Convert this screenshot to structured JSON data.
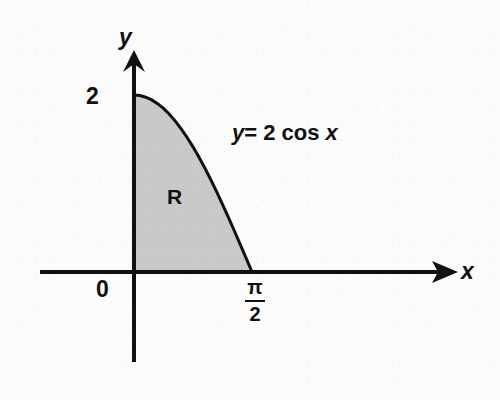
{
  "figure": {
    "background_color": "#fbfbfb",
    "ink_color": "#111111",
    "shade_color": "#c9c9c9"
  },
  "axes": {
    "y_axis_label": "y",
    "x_axis_label": "x",
    "origin_label": "0",
    "y_tick_label": "2",
    "x_tick_numerator": "π",
    "x_tick_denominator": "2"
  },
  "annotations": {
    "region_label": "R",
    "curve_equation_y": "y",
    "curve_equation_mid": "= 2 cos ",
    "curve_equation_x": "x",
    "curve_equation_full": "y = 2 cos x"
  },
  "chart_data": {
    "type": "area",
    "title": "",
    "xlabel": "x",
    "ylabel": "y",
    "function": "y = 2 cos x",
    "shaded_region_name": "R",
    "shaded_region_bounds": {
      "x_from": 0,
      "x_to": 1.5707963,
      "x_to_label": "π/2",
      "y_from": 0,
      "y_to_label": "2"
    },
    "xlim": [
      -1.05,
      3.05
    ],
    "ylim": [
      -1.25,
      2.45
    ],
    "grid": false,
    "legend": false,
    "x_tick_values": [
      0,
      1.5707963
    ],
    "x_tick_labels": [
      "0",
      "π/2"
    ],
    "y_tick_values": [
      2
    ],
    "y_tick_labels": [
      "2"
    ],
    "x": [
      0,
      0.0785,
      0.1571,
      0.2356,
      0.3142,
      0.3927,
      0.4712,
      0.5498,
      0.6283,
      0.7069,
      0.7854,
      0.8639,
      0.9425,
      1.021,
      1.0996,
      1.1781,
      1.2566,
      1.3352,
      1.4137,
      1.4923,
      1.5708
    ],
    "y": [
      2.0,
      1.994,
      1.975,
      1.945,
      1.902,
      1.848,
      1.782,
      1.705,
      1.618,
      1.52,
      1.414,
      1.299,
      1.176,
      1.045,
      0.908,
      0.765,
      0.618,
      0.466,
      0.313,
      0.157,
      0.0
    ]
  }
}
